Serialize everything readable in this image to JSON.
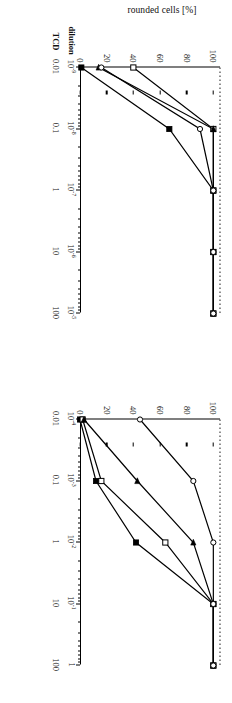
{
  "figure": {
    "orientation": "rotated-90-cw",
    "axis_label_y": "rounded cells [%]",
    "axis_name_dilution": "dilution",
    "axis_name_tcd": "TCD",
    "y_ticks": [
      "0",
      "20",
      "40",
      "60",
      "80",
      "100"
    ],
    "reference_level": 50
  },
  "chart_data": [
    {
      "type": "line",
      "panel": "left",
      "title": "",
      "xlabel": "dilution / TCD",
      "ylabel": "rounded cells [%]",
      "xscale": "log",
      "x_tick_labels_dilution": [
        "10⁻⁹",
        "10⁻⁸",
        "10⁻⁷",
        "10⁻⁶",
        "10⁻⁵"
      ],
      "x_tick_labels_tcd": [
        "0.01",
        "0.1",
        "1",
        "10",
        "100"
      ],
      "x_log_decades": [
        -9,
        -8,
        -7,
        -6,
        -5
      ],
      "ylim": [
        0,
        105
      ],
      "y_ticks": [
        0,
        20,
        40,
        60,
        80,
        100
      ],
      "grid": false,
      "reference_lines": {
        "horizontal_50": true,
        "vertical_ed50": true
      },
      "series": [
        {
          "name": "filled-square",
          "marker": "filled-square",
          "x": [
            -9.0,
            -8.0,
            -7.0,
            -6.0,
            -5.0
          ],
          "values": [
            1,
            67,
            100,
            100,
            100
          ]
        },
        {
          "name": "open-square",
          "marker": "open-square",
          "x": [
            -9.0,
            -8.0,
            -7.0,
            -6.0,
            -5.0
          ],
          "values": [
            40,
            100,
            100,
            100,
            100
          ]
        },
        {
          "name": "filled-triangle",
          "marker": "filled-triangle",
          "x": [
            -9.0,
            -8.0,
            -7.0,
            -6.0,
            -5.0
          ],
          "values": [
            14,
            100,
            100,
            100,
            100
          ]
        },
        {
          "name": "open-circle",
          "marker": "open-circle",
          "x": [
            -9.0,
            -8.0,
            -7.0,
            -6.0,
            -5.0
          ],
          "values": [
            16,
            90,
            100,
            100,
            100
          ]
        }
      ]
    },
    {
      "type": "line",
      "panel": "right",
      "title": "",
      "xlabel": "dilution / TCD",
      "ylabel": "rounded cells [%]",
      "xscale": "log",
      "x_tick_labels_dilution": [
        "10⁻⁴",
        "10⁻³",
        "10⁻²",
        "10⁻¹",
        "1"
      ],
      "x_tick_labels_tcd": [
        "0.01",
        "0.1",
        "1",
        "10",
        "100"
      ],
      "x_log_decades": [
        -4,
        -3,
        -2,
        -1,
        0
      ],
      "ylim": [
        0,
        105
      ],
      "y_ticks": [
        0,
        20,
        40,
        60,
        80,
        100
      ],
      "grid": false,
      "reference_lines": {
        "horizontal_50": true,
        "vertical_ed50": true
      },
      "series": [
        {
          "name": "filled-square",
          "marker": "filled-square",
          "x": [
            -4.0,
            -3.0,
            -2.0,
            -1.0,
            0.0
          ],
          "values": [
            0,
            12,
            42,
            100,
            100
          ]
        },
        {
          "name": "open-square",
          "marker": "open-square",
          "x": [
            -4.0,
            -3.0,
            -2.0,
            -1.0,
            0.0
          ],
          "values": [
            2,
            16,
            64,
            100,
            100
          ]
        },
        {
          "name": "filled-triangle",
          "marker": "filled-triangle",
          "x": [
            -4.0,
            -3.0,
            -2.0,
            -1.0,
            0.0
          ],
          "values": [
            3,
            43,
            85,
            100,
            100
          ]
        },
        {
          "name": "open-circle",
          "marker": "open-circle",
          "x": [
            -4.0,
            -3.0,
            -2.0,
            -1.0,
            0.0
          ],
          "values": [
            45,
            85,
            100,
            100,
            100
          ]
        }
      ]
    }
  ],
  "colors": {
    "line": "#000000",
    "axis": "#000000",
    "reference": "#333333",
    "background": "#ffffff"
  }
}
